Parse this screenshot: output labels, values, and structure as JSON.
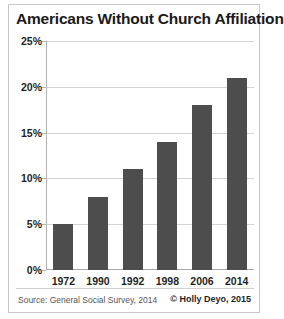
{
  "chart_data": {
    "type": "bar",
    "title": "Americans Without Church Affiliation",
    "categories": [
      "1972",
      "1990",
      "1992",
      "1998",
      "2006",
      "2014"
    ],
    "values": [
      5,
      8,
      11,
      14,
      18,
      21
    ],
    "value_suffix": "%",
    "xlabel": "",
    "ylabel": "",
    "ylim": [
      0,
      25
    ],
    "ytick_labels": [
      "25%",
      "20%",
      "15%",
      "10%",
      "5%",
      "0%"
    ],
    "ytick_values": [
      25,
      20,
      15,
      10,
      5,
      0
    ],
    "grid": true,
    "legend": false,
    "bar_color": "#4d4d4d",
    "gridline_color": "#d2d2d2",
    "axis_color": "#b4b4b4"
  },
  "footer": {
    "source": "Source: General Social Survey, 2014",
    "credit": "© Holly Deyo, 2015"
  }
}
